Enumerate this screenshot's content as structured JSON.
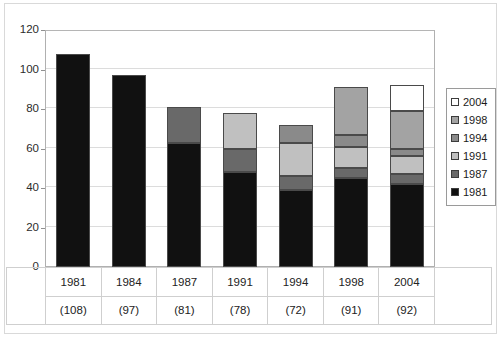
{
  "title": "",
  "chart_data": {
    "type": "bar",
    "subtype": "stacked-bar",
    "title": "",
    "xlabel": "",
    "ylabel": "",
    "ylim": [
      0,
      120
    ],
    "ytick_step": 20,
    "yticks": [
      0,
      20,
      40,
      60,
      80,
      100,
      120
    ],
    "ytick_labels": [
      "0",
      "20",
      "40",
      "60",
      "80",
      "100",
      "120"
    ],
    "grid": "horizontal",
    "legend_position": "right",
    "categories": [
      "1981",
      "1984",
      "1987",
      "1991",
      "1994",
      "1998",
      "2004"
    ],
    "category_sublabels": [
      "(108)",
      "(97)",
      "(81)",
      "(78)",
      "(72)",
      "(91)",
      "(92)"
    ],
    "totals": [
      108,
      97,
      81,
      78,
      72,
      91,
      92
    ],
    "series": [
      {
        "name": "1981",
        "color": "#111111",
        "values": [
          108,
          97,
          63,
          48,
          39,
          45,
          42
        ]
      },
      {
        "name": "1987",
        "color": "#696969",
        "values": [
          0,
          0,
          18,
          12,
          7,
          5,
          5
        ]
      },
      {
        "name": "1991",
        "color": "#c0c0c0",
        "values": [
          0,
          0,
          0,
          18,
          17,
          11,
          9
        ]
      },
      {
        "name": "1994",
        "color": "#8a8a8a",
        "values": [
          0,
          0,
          0,
          0,
          9,
          6,
          4
        ]
      },
      {
        "name": "1998",
        "color": "#a3a3a3",
        "values": [
          0,
          0,
          0,
          0,
          0,
          24,
          19
        ]
      },
      {
        "name": "2004",
        "color": "#ffffff",
        "values": [
          0,
          0,
          0,
          0,
          0,
          0,
          13
        ]
      }
    ]
  },
  "legend": {
    "items": [
      {
        "label": "2004",
        "color": "#ffffff"
      },
      {
        "label": "1998",
        "color": "#a3a3a3"
      },
      {
        "label": "1994",
        "color": "#8a8a8a"
      },
      {
        "label": "1991",
        "color": "#c0c0c0"
      },
      {
        "label": "1987",
        "color": "#696969"
      },
      {
        "label": "1981",
        "color": "#111111"
      }
    ]
  },
  "colors": {
    "axis": "#b0b0b0",
    "grid": "#dcdcdc",
    "frame": "#d9d9d9",
    "text": "#222222",
    "segment_border": "#4a4a4a"
  }
}
